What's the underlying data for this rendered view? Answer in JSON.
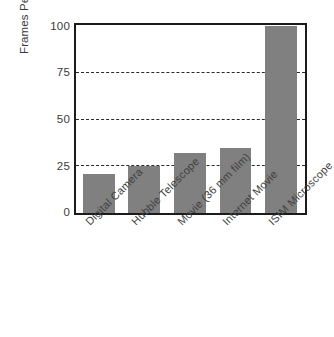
{
  "chart_data": {
    "type": "bar",
    "title": "",
    "xlabel": "",
    "ylabel": "Frames Per Second",
    "categories": [
      "Digital Camera",
      "Hubble Telescope",
      "Movie (36 mm film)",
      "Internet Movie",
      "ISIM Microscope"
    ],
    "values": [
      21,
      25,
      32,
      35,
      100
    ],
    "ylim": [
      0,
      100
    ],
    "yticks": [
      0,
      25,
      50,
      75,
      100
    ],
    "ytick_labels": [
      "0",
      "25",
      "50",
      "75",
      "100"
    ],
    "gridlines": [
      25,
      50,
      75
    ],
    "grid": true,
    "grid_style": "dashed",
    "legend": "none",
    "bar_color": "#808080",
    "axis_color": "#1b1b1b",
    "text_color": "#3a3a3a"
  }
}
